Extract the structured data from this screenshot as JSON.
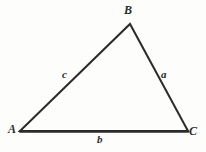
{
  "figure": {
    "type": "triangle-diagram",
    "background_color": "#fdfdfc",
    "stroke_color": "#2b2b2b",
    "stroke_width": 2,
    "vertices": [
      {
        "name": "A",
        "label": "A",
        "x": 20,
        "y": 131
      },
      {
        "name": "B",
        "label": "B",
        "x": 130,
        "y": 24
      },
      {
        "name": "C",
        "label": "C",
        "x": 188,
        "y": 131
      }
    ],
    "sides": [
      {
        "name": "a",
        "label": "a",
        "from": "B",
        "to": "C",
        "label_x": 165,
        "label_y": 74
      },
      {
        "name": "b",
        "label": "b",
        "from": "A",
        "to": "C",
        "label_x": 101,
        "label_y": 139
      },
      {
        "name": "c",
        "label": "c",
        "from": "A",
        "to": "B",
        "label_x": 66,
        "label_y": 74
      }
    ],
    "path": "M 20 131 L 130 24 L 188 131 Z"
  }
}
